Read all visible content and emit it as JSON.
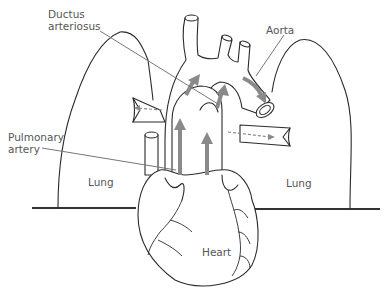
{
  "diagram": {
    "labels": {
      "ductus_arteriosus_line1": "Ductus",
      "ductus_arteriosus_line2": "arteriosus",
      "aorta": "Aorta",
      "pulmonary_artery_line1": "Pulmonary",
      "pulmonary_artery_line2": "artery",
      "lung_left": "Lung",
      "lung_right": "Lung",
      "heart": "Heart"
    },
    "colors": {
      "outline": "#2a2a2a",
      "flow_arrows": "#8a8a8a",
      "label_text": "#555555",
      "leader_lines": "#777777",
      "baseline": "#333333"
    },
    "flow_arrows": [
      "pulmonary trunk upward (solid)",
      "ascending aorta upward (solid)",
      "ductus arteriosus upward (solid)",
      "aortic arch curving to descending aorta (solid)",
      "left pulmonary branch to lung (dashed)",
      "right pulmonary branch to lung (dashed)"
    ]
  }
}
